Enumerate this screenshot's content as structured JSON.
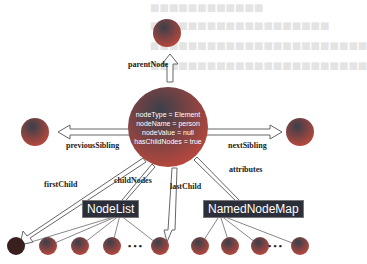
{
  "diagram": {
    "center_node": {
      "lines": [
        "nodeType = Element",
        "nodeName = person",
        "nodeValue = null",
        "hasChildNodes = true"
      ]
    },
    "edges": {
      "parent": "parentNode",
      "previous": "previousSibling",
      "next": "nextSibling",
      "first": "firstChild",
      "children": "childNodes",
      "last": "lastChild",
      "attrs": "attributes"
    },
    "collections": {
      "nodelist": "NodeList",
      "namednodemap": "NamedNodeMap"
    },
    "ellipsis": "• • •",
    "colors": {
      "node": "#a8423a",
      "box": "#2b2f3a"
    }
  }
}
